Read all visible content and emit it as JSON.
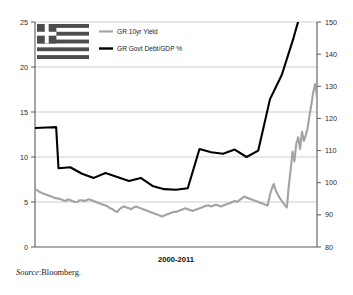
{
  "chart_data": {
    "type": "line",
    "title": "",
    "subtitle": "",
    "xlabel": "2000-2011",
    "ylabel": "",
    "grid": true,
    "legend_position": "top-left",
    "axes": {
      "left": {
        "label": "GR 10yr Yield",
        "ylim": [
          0,
          25
        ],
        "ticks": [
          0,
          5,
          10,
          15,
          20,
          25
        ],
        "tick_labels": [
          "0",
          "5",
          "10",
          "15",
          "20",
          "25"
        ]
      },
      "right": {
        "label": "GR Govt Debt/GDP %",
        "ylim": [
          80,
          150
        ],
        "ticks": [
          80,
          90,
          100,
          110,
          120,
          130,
          140,
          150
        ],
        "tick_labels": [
          "80",
          "90",
          "100",
          "110",
          "120",
          "130",
          "140",
          "150"
        ]
      },
      "x": {
        "range_label": "2000-2011",
        "start": 2000,
        "end": 2011
      }
    },
    "series": [
      {
        "name": "GR 10yr Yield",
        "axis": "left",
        "color": "#a3a3a3",
        "linewidth": 2.1,
        "x": [
          2000.0,
          2000.1,
          2000.2,
          2000.3,
          2000.4,
          2000.5,
          2000.6,
          2000.7,
          2000.8,
          2000.9,
          2001.0,
          2001.1,
          2001.2,
          2001.3,
          2001.4,
          2001.5,
          2001.6,
          2001.7,
          2001.8,
          2001.9,
          2002.0,
          2002.1,
          2002.2,
          2002.3,
          2002.4,
          2002.5,
          2002.6,
          2002.7,
          2002.8,
          2002.9,
          2003.0,
          2003.1,
          2003.2,
          2003.3,
          2003.4,
          2003.5,
          2003.6,
          2003.7,
          2003.8,
          2003.9,
          2004.0,
          2004.1,
          2004.2,
          2004.3,
          2004.4,
          2004.5,
          2004.6,
          2004.7,
          2004.8,
          2004.9,
          2005.0,
          2005.1,
          2005.2,
          2005.3,
          2005.4,
          2005.5,
          2005.6,
          2005.7,
          2005.8,
          2005.9,
          2006.0,
          2006.1,
          2006.2,
          2006.3,
          2006.4,
          2006.5,
          2006.6,
          2006.7,
          2006.8,
          2006.9,
          2007.0,
          2007.1,
          2007.2,
          2007.3,
          2007.4,
          2007.5,
          2007.6,
          2007.7,
          2007.8,
          2007.9,
          2008.0,
          2008.1,
          2008.2,
          2008.3,
          2008.4,
          2008.5,
          2008.6,
          2008.7,
          2008.8,
          2008.9,
          2009.0,
          2009.1,
          2009.2,
          2009.3,
          2009.4,
          2009.5,
          2009.6,
          2009.7,
          2009.8,
          2009.9,
          2010.0,
          2010.08,
          2010.16,
          2010.24,
          2010.32,
          2010.4,
          2010.48,
          2010.56,
          2010.64,
          2010.72,
          2010.8,
          2010.88,
          2010.96,
          2011.04,
          2011.12,
          2011.2,
          2011.28,
          2011.36,
          2011.44,
          2011.52,
          2011.6,
          2011.68,
          2011.76,
          2011.84,
          2011.92,
          2012.0
        ],
        "y": [
          6.4,
          6.3,
          6.1,
          6.0,
          5.9,
          5.8,
          5.7,
          5.6,
          5.5,
          5.4,
          5.4,
          5.3,
          5.2,
          5.1,
          5.3,
          5.2,
          5.1,
          5.0,
          5.0,
          5.2,
          5.2,
          5.1,
          5.2,
          5.3,
          5.2,
          5.1,
          5.0,
          4.9,
          4.8,
          4.7,
          4.6,
          4.5,
          4.3,
          4.2,
          4.0,
          3.9,
          4.2,
          4.4,
          4.5,
          4.4,
          4.3,
          4.2,
          4.4,
          4.5,
          4.4,
          4.3,
          4.2,
          4.1,
          4.0,
          3.9,
          3.8,
          3.7,
          3.6,
          3.5,
          3.4,
          3.5,
          3.6,
          3.7,
          3.8,
          3.9,
          3.9,
          4.0,
          4.1,
          4.2,
          4.3,
          4.2,
          4.1,
          4.0,
          4.1,
          4.2,
          4.3,
          4.4,
          4.5,
          4.6,
          4.6,
          4.5,
          4.6,
          4.7,
          4.6,
          4.5,
          4.6,
          4.7,
          4.8,
          4.9,
          5.0,
          5.1,
          5.0,
          5.2,
          5.4,
          5.6,
          5.5,
          5.4,
          5.3,
          5.2,
          5.1,
          5.0,
          4.9,
          4.8,
          4.7,
          4.6,
          5.8,
          6.5,
          7.0,
          6.3,
          5.9,
          5.5,
          5.2,
          4.9,
          4.6,
          4.4,
          6.8,
          8.6,
          10.6,
          9.5,
          11.5,
          12.2,
          10.9,
          12.8,
          11.8,
          12.4,
          13.2,
          14.6,
          15.8,
          17.2,
          18.1,
          16.6
        ]
      },
      {
        "name": "GR Govt Debt/GDP %",
        "axis": "right",
        "color": "#000000",
        "linewidth": 2.1,
        "x": [
          2000.0,
          2000.5,
          2000.9,
          2001.0,
          2001.5,
          2002.0,
          2002.5,
          2003.0,
          2003.5,
          2004.0,
          2004.5,
          2005.0,
          2005.5,
          2006.0,
          2006.5,
          2007.0,
          2007.5,
          2008.0,
          2008.5,
          2009.0,
          2009.5,
          2010.0,
          2010.5,
          2011.0,
          2011.5,
          2012.0
        ],
        "y": [
          117.0,
          117.2,
          117.3,
          104.5,
          104.8,
          102.8,
          101.5,
          103.0,
          101.8,
          100.5,
          101.5,
          99.0,
          98.0,
          97.8,
          98.3,
          110.5,
          109.5,
          109.0,
          110.3,
          108.0,
          110.0,
          126.0,
          133.5,
          145.0,
          158.0,
          170.0
        ]
      }
    ],
    "annotations": [
      {
        "name": "greek-flag",
        "type": "image",
        "description": "Greek national flag, grayscale"
      }
    ]
  },
  "legend": {
    "items": [
      {
        "label": "GR 10yr Yield",
        "color": "#a3a3a3"
      },
      {
        "label": "GR Govt Debt/GDP %",
        "color": "#000000"
      }
    ]
  },
  "footer": {
    "source_word": "Source",
    "source_separator": ":",
    "source_value": "Bloomberg."
  }
}
